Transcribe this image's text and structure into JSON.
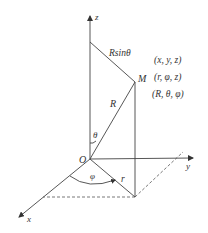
{
  "diagram": {
    "type": "spherical-cylindrical-coordinate-system",
    "axes": {
      "z": "z",
      "y": "y",
      "x": "x"
    },
    "origin_label": "O",
    "point_label": "M",
    "segments": {
      "radius_label": "R",
      "projection_label": "r",
      "rsin_label": "Rsinθ"
    },
    "angles": {
      "theta": "θ",
      "phi": "φ"
    },
    "coordinates": [
      "(x, y, z)",
      "(r, φ, z)",
      "(R, θ, φ)"
    ],
    "colors": {
      "line": "#444444",
      "text": "#333333",
      "background": "#ffffff"
    }
  }
}
